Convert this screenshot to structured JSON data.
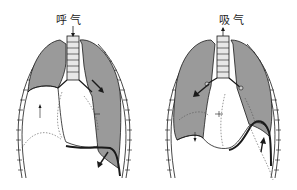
{
  "diagram": {
    "panels": [
      {
        "id": "exhale",
        "label": "呼气",
        "airflow_direction": "down",
        "collapsed_side": "left",
        "mediastinum_shift": "right",
        "diaphragm_motion": "down"
      },
      {
        "id": "inhale",
        "label": "吸气",
        "airflow_direction": "up",
        "collapsed_side": "left",
        "mediastinum_shift": "left",
        "diaphragm_motion": "up"
      }
    ],
    "colors": {
      "lung_fill": "#9a9a9a",
      "outline": "#1a1a1a",
      "background": "#ffffff",
      "rib": "#d8d8d8"
    }
  }
}
